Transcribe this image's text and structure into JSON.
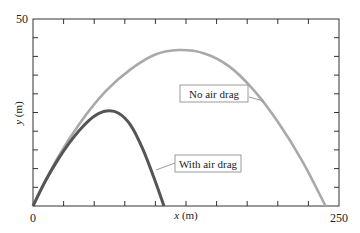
{
  "chart_data": {
    "type": "line",
    "title": "",
    "xlabel": "x (m)",
    "ylabel": "y (m)",
    "xlabel_var": "x",
    "xlabel_unit": " (m)",
    "ylabel_var": "y",
    "ylabel_unit": " (m)",
    "xlim": [
      0,
      250
    ],
    "ylim": [
      0,
      50
    ],
    "x_tick_labels": [
      {
        "value": 0,
        "label": "0"
      },
      {
        "value": 250,
        "label": "250"
      }
    ],
    "y_tick_labels": [
      {
        "value": 50,
        "label": "50"
      }
    ],
    "x_minor_tick_step": 25,
    "y_minor_tick_step": 5,
    "grid": false,
    "legend": "none (callout labels)",
    "series": [
      {
        "name": "No air drag",
        "color": "#a9a9a9",
        "x": [
          0,
          20,
          40,
          60,
          80,
          100,
          119,
          140,
          160,
          180,
          200,
          220,
          239
        ],
        "y": [
          0,
          12.8,
          22.9,
          30.9,
          36.6,
          40.5,
          41.7,
          40.8,
          37.4,
          31.1,
          22.5,
          12.0,
          0
        ]
      },
      {
        "name": "With air drag",
        "color": "#555555",
        "x": [
          0,
          10,
          20,
          30,
          40,
          50,
          60,
          70,
          80,
          90,
          100,
          107
        ],
        "y": [
          0,
          6.6,
          12.2,
          17.0,
          21.0,
          24.0,
          25.4,
          24.8,
          21.5,
          15.0,
          6.5,
          0
        ]
      }
    ],
    "annotations": [
      {
        "text": "No air drag",
        "target_series": "No air drag"
      },
      {
        "text": "With air drag",
        "target_series": "With air drag"
      }
    ]
  },
  "colors": {
    "axis": "#333333",
    "no_drag": "#a9a9a9",
    "with_drag": "#555555",
    "callout_border": "#9a9a9a"
  }
}
